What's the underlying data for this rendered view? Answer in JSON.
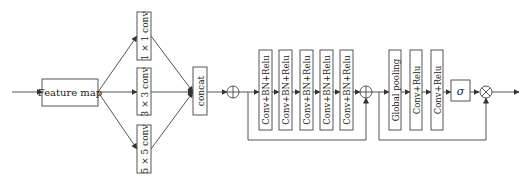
{
  "diagram": {
    "colors": {
      "stroke": "#555555",
      "text": "#222222",
      "background": "#ffffff"
    },
    "input_block": {
      "label": "Feature map"
    },
    "branches": [
      {
        "label": "1 × 1 conv"
      },
      {
        "label": "3 × 3 conv"
      },
      {
        "label": "5 × 5 conv"
      }
    ],
    "concat": {
      "label": "concat"
    },
    "add_ops": [
      {
        "symbol": "⊕",
        "name": "add-1"
      },
      {
        "symbol": "⊕",
        "name": "add-2"
      }
    ],
    "residual_blocks": [
      {
        "label": "Conv+BN+Relu"
      },
      {
        "label": "Conv+BN+Relu"
      },
      {
        "label": "Conv+BN+Relu"
      },
      {
        "label": "Conv+BN+Relu"
      },
      {
        "label": "Conv+BN+Relu"
      }
    ],
    "attention_blocks": [
      {
        "label": "Global pooling"
      },
      {
        "label": "Conv+Relu"
      },
      {
        "label": "Conv+Relu"
      }
    ],
    "sigmoid": {
      "label": "σ"
    },
    "multiply_op": {
      "symbol": "⊗"
    }
  }
}
